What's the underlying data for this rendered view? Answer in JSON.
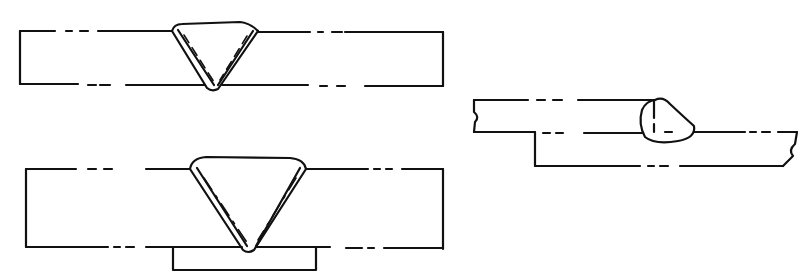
{
  "figure": {
    "title": "Weld joint sketches",
    "panels": [
      {
        "id": "single-v-butt-weld",
        "label": "Single-V butt weld (open root)"
      },
      {
        "id": "single-v-butt-weld-backing",
        "label": "Single-V butt weld with backing strip"
      },
      {
        "id": "lap-fillet-weld",
        "label": "Lap joint fillet weld"
      }
    ],
    "colors": {
      "line": "#111111",
      "background": "#ffffff"
    }
  }
}
